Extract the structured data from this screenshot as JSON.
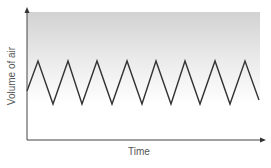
{
  "chart_data": {
    "type": "line",
    "title": "",
    "xlabel": "Time",
    "ylabel": "Volume of air",
    "grid": false,
    "legend": null,
    "shaded_region": {
      "description": "gray gradient band above the tidal breathing trace, fading to white downward",
      "top_color": "#d4d4d4",
      "bottom_color": "#ffffff"
    },
    "series": [
      {
        "name": "tidal breathing",
        "color": "#333333",
        "pattern": "zigzag",
        "points_px": [
          [
            27,
            91
          ],
          [
            38,
            61
          ],
          [
            53,
            104
          ],
          [
            68,
            61
          ],
          [
            82,
            104
          ],
          [
            97,
            61
          ],
          [
            112,
            104
          ],
          [
            127,
            61
          ],
          [
            142,
            104
          ],
          [
            156,
            61
          ],
          [
            171,
            104
          ],
          [
            185,
            61
          ],
          [
            200,
            104
          ],
          [
            215,
            61
          ],
          [
            230,
            104
          ],
          [
            245,
            61
          ],
          [
            259,
            100
          ]
        ],
        "cycles": 8
      }
    ]
  },
  "axes": {
    "x_label": "Time",
    "y_label": "Volume of air"
  },
  "colors": {
    "axis": "#444444",
    "trace": "#333333",
    "label": "#555555",
    "gradient_top": "#d4d4d4",
    "gradient_bottom": "#ffffff"
  }
}
